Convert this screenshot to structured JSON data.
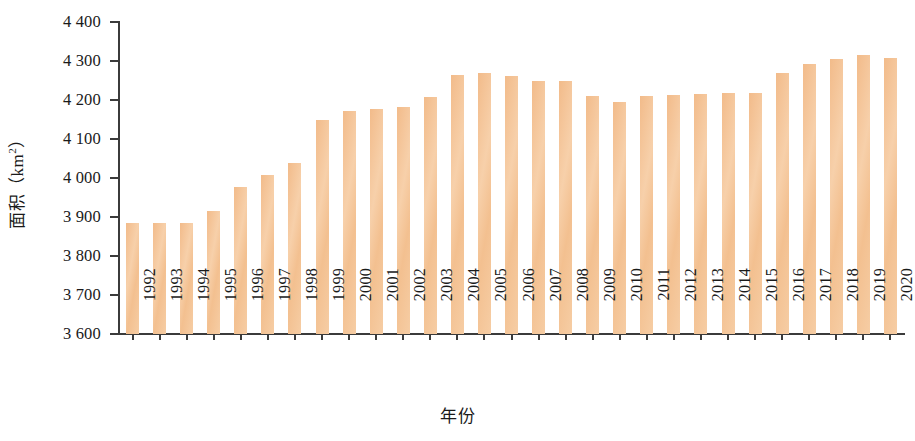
{
  "chart_data": {
    "type": "bar",
    "title": "",
    "xlabel": "年份",
    "ylabel": "面积（km²）",
    "ylabel_main": "面积（km",
    "ylabel_sup": "2",
    "ylabel_tail": "）",
    "ylim": [
      3600,
      4400
    ],
    "ytick_step": 100,
    "grid": false,
    "legend": "none",
    "bar_color": "#f3c391",
    "axis_color": "#3b3b3b",
    "categories": [
      "1992",
      "1993",
      "1994",
      "1995",
      "1996",
      "1997",
      "1998",
      "1999",
      "2000",
      "2001",
      "2002",
      "2003",
      "2004",
      "2005",
      "2006",
      "2007",
      "2008",
      "2009",
      "2010",
      "2011",
      "2012",
      "2013",
      "2014",
      "2015",
      "2016",
      "2017",
      "2018",
      "2019",
      "2020"
    ],
    "values": [
      3885,
      3885,
      3885,
      3915,
      3978,
      4008,
      4038,
      4148,
      4172,
      4177,
      4182,
      4207,
      4265,
      4270,
      4262,
      4250,
      4250,
      4210,
      4196,
      4210,
      4212,
      4216,
      4218,
      4218,
      4270,
      4292,
      4305,
      4315,
      4308
    ],
    "ytick_labels": [
      "4 400",
      "4 300",
      "4 200",
      "4 100",
      "4 000",
      "3 900",
      "3 800",
      "3 700",
      "3 600"
    ],
    "ytick_values": [
      4400,
      4300,
      4200,
      4100,
      4000,
      3900,
      3800,
      3700,
      3600
    ]
  }
}
